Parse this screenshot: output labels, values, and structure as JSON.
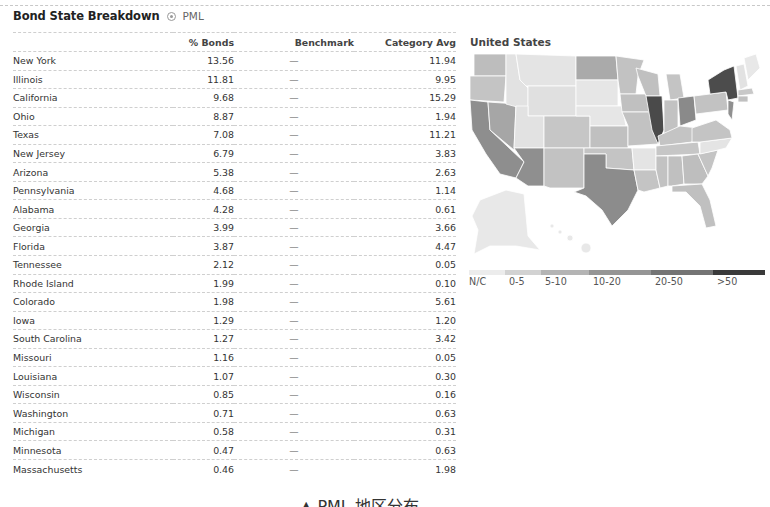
{
  "header": {
    "title": "Bond State Breakdown",
    "help_icon": "help-icon",
    "ticker": "PML"
  },
  "table": {
    "columns": [
      "",
      "% Bonds",
      "Benchmark",
      "Category Avg"
    ],
    "rows": [
      {
        "state": "New York",
        "bonds": "13.56",
        "benchmark": "—",
        "category_avg": "11.94"
      },
      {
        "state": "Illinois",
        "bonds": "11.81",
        "benchmark": "—",
        "category_avg": "9.95"
      },
      {
        "state": "California",
        "bonds": "9.68",
        "benchmark": "—",
        "category_avg": "15.29"
      },
      {
        "state": "Ohio",
        "bonds": "8.87",
        "benchmark": "—",
        "category_avg": "1.94"
      },
      {
        "state": "Texas",
        "bonds": "7.08",
        "benchmark": "—",
        "category_avg": "11.21"
      },
      {
        "state": "New Jersey",
        "bonds": "6.79",
        "benchmark": "—",
        "category_avg": "3.83"
      },
      {
        "state": "Arizona",
        "bonds": "5.38",
        "benchmark": "—",
        "category_avg": "2.63"
      },
      {
        "state": "Pennsylvania",
        "bonds": "4.68",
        "benchmark": "—",
        "category_avg": "1.14"
      },
      {
        "state": "Alabama",
        "bonds": "4.28",
        "benchmark": "—",
        "category_avg": "0.61"
      },
      {
        "state": "Georgia",
        "bonds": "3.99",
        "benchmark": "—",
        "category_avg": "3.66"
      },
      {
        "state": "Florida",
        "bonds": "3.87",
        "benchmark": "—",
        "category_avg": "4.47"
      },
      {
        "state": "Tennessee",
        "bonds": "2.12",
        "benchmark": "—",
        "category_avg": "0.05"
      },
      {
        "state": "Rhode Island",
        "bonds": "1.99",
        "benchmark": "—",
        "category_avg": "0.10"
      },
      {
        "state": "Colorado",
        "bonds": "1.98",
        "benchmark": "—",
        "category_avg": "5.61"
      },
      {
        "state": "Iowa",
        "bonds": "1.29",
        "benchmark": "—",
        "category_avg": "1.20"
      },
      {
        "state": "South Carolina",
        "bonds": "1.27",
        "benchmark": "—",
        "category_avg": "3.42"
      },
      {
        "state": "Missouri",
        "bonds": "1.16",
        "benchmark": "—",
        "category_avg": "0.05"
      },
      {
        "state": "Louisiana",
        "bonds": "1.07",
        "benchmark": "—",
        "category_avg": "0.30"
      },
      {
        "state": "Wisconsin",
        "bonds": "0.85",
        "benchmark": "—",
        "category_avg": "0.16"
      },
      {
        "state": "Washington",
        "bonds": "0.71",
        "benchmark": "—",
        "category_avg": "0.63"
      },
      {
        "state": "Michigan",
        "bonds": "0.58",
        "benchmark": "—",
        "category_avg": "0.31"
      },
      {
        "state": "Minnesota",
        "bonds": "0.47",
        "benchmark": "—",
        "category_avg": "0.63"
      },
      {
        "state": "Massachusetts",
        "bonds": "0.46",
        "benchmark": "—",
        "category_avg": "1.98"
      }
    ]
  },
  "map": {
    "title": "United States",
    "legend": [
      {
        "label": "N/C",
        "color": "#ececec"
      },
      {
        "label": "0-5",
        "color": "#d2d2d2"
      },
      {
        "label": "5-10",
        "color": "#b4b4b4"
      },
      {
        "label": "10-20",
        "color": "#959595"
      },
      {
        "label": "20-50",
        "color": "#747474"
      },
      {
        "label": ">50",
        "color": "#3a3a3a"
      }
    ]
  },
  "caption": "▲ PML 地区分布"
}
